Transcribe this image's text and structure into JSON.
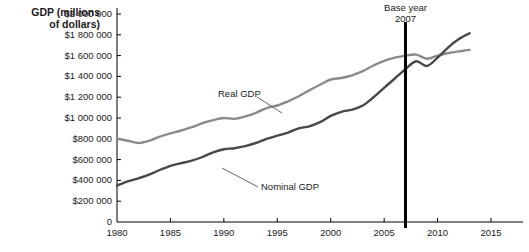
{
  "chart_data": {
    "type": "line",
    "title": "",
    "ylabel": "GDP (millions of dollars)",
    "xlabel": "",
    "xlim": [
      1980,
      2015
    ],
    "ylim": [
      0,
      2000000
    ],
    "grid": false,
    "legend_position": "inline-annotations",
    "xticks": [
      "1980",
      "1985",
      "1990",
      "1995",
      "2000",
      "2005",
      "2010",
      "2015"
    ],
    "xtick_values": [
      1980,
      1985,
      1990,
      1995,
      2000,
      2005,
      2010,
      2015
    ],
    "yticks": [
      "0",
      "$200 000",
      "$400 000",
      "$600 000",
      "$800 000",
      "$1 000 000",
      "$1 200 000",
      "$1 400 000",
      "$1 600 000",
      "$1 800 000",
      "$2 000 000"
    ],
    "ytick_values": [
      0,
      200000,
      400000,
      600000,
      800000,
      1000000,
      1200000,
      1400000,
      1600000,
      1800000,
      2000000
    ],
    "annotations": [
      {
        "name": "base-year",
        "text_line1": "Base year",
        "text_line2": "2007",
        "x_value": 2007
      }
    ],
    "x": [
      1980,
      1981,
      1982,
      1983,
      1984,
      1985,
      1986,
      1987,
      1988,
      1989,
      1990,
      1991,
      1992,
      1993,
      1994,
      1995,
      1996,
      1997,
      1998,
      1999,
      2000,
      2001,
      2002,
      2003,
      2004,
      2005,
      2006,
      2007,
      2008,
      2009,
      2010,
      2011,
      2012,
      2013
    ],
    "series": [
      {
        "name": "Real GDP",
        "color": "#8a8a8a",
        "label": "Real GDP",
        "values": [
          800000,
          782000,
          760000,
          780000,
          820000,
          852000,
          880000,
          912000,
          950000,
          980000,
          1000000,
          992000,
          1015000,
          1050000,
          1095000,
          1120000,
          1160000,
          1210000,
          1265000,
          1320000,
          1370000,
          1385000,
          1410000,
          1450000,
          1505000,
          1550000,
          1580000,
          1600000,
          1610000,
          1570000,
          1600000,
          1625000,
          1640000,
          1655000
        ]
      },
      {
        "name": "Nominal GDP",
        "color": "#484848",
        "label": "Nominal GDP",
        "values": [
          350000,
          390000,
          420000,
          455000,
          500000,
          540000,
          565000,
          590000,
          625000,
          670000,
          700000,
          710000,
          730000,
          760000,
          800000,
          830000,
          860000,
          900000,
          920000,
          960000,
          1020000,
          1060000,
          1080000,
          1120000,
          1200000,
          1290000,
          1380000,
          1470000,
          1545000,
          1500000,
          1580000,
          1680000,
          1760000,
          1815000
        ]
      }
    ]
  },
  "axis": {
    "y_title_line1": "GDP (millions",
    "y_title_line2": "of dollars)"
  }
}
